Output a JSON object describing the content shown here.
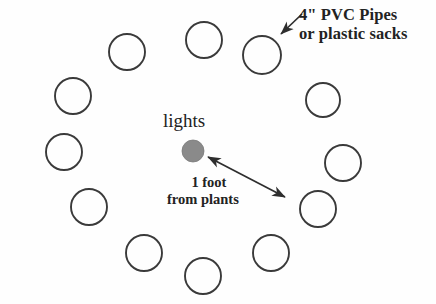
{
  "diagram": {
    "background_color": "#fefefe",
    "stroke_color": "#3a3a3a",
    "light_fill_color": "#8a8a8a",
    "annotations": {
      "pipes_label_line1": "4\" PVC Pipes",
      "pipes_label_line2": "or plastic sacks",
      "lights_label": "lights",
      "distance_line1": "1 foot",
      "distance_line2": "from plants"
    },
    "center_light": {
      "name": "lights",
      "cx": 193,
      "cy": 151,
      "r": 11,
      "fill": "#8a8a8a"
    },
    "pipes": [
      {
        "id": 1,
        "cx": 204,
        "cy": 40,
        "r": 18
      },
      {
        "id": 2,
        "cx": 262,
        "cy": 55,
        "r": 19
      },
      {
        "id": 3,
        "cx": 323,
        "cy": 100,
        "r": 17
      },
      {
        "id": 4,
        "cx": 343,
        "cy": 163,
        "r": 18
      },
      {
        "id": 5,
        "cx": 318,
        "cy": 209,
        "r": 18
      },
      {
        "id": 6,
        "cx": 271,
        "cy": 253,
        "r": 18
      },
      {
        "id": 7,
        "cx": 203,
        "cy": 276,
        "r": 18
      },
      {
        "id": 8,
        "cx": 144,
        "cy": 253,
        "r": 18
      },
      {
        "id": 9,
        "cx": 89,
        "cy": 207,
        "r": 18
      },
      {
        "id": 10,
        "cx": 64,
        "cy": 152,
        "r": 18
      },
      {
        "id": 11,
        "cx": 73,
        "cy": 96,
        "r": 18
      },
      {
        "id": 12,
        "cx": 127,
        "cy": 52,
        "r": 18
      }
    ],
    "pointer_arrow": {
      "name": "pvc-pointer-arrow",
      "x1": 302,
      "y1": 14,
      "x2": 281,
      "y2": 34
    },
    "distance_arrow": {
      "name": "one-foot-double-arrow",
      "x1": 208,
      "y1": 157,
      "x2": 285,
      "y2": 197,
      "double_headed": true
    }
  }
}
